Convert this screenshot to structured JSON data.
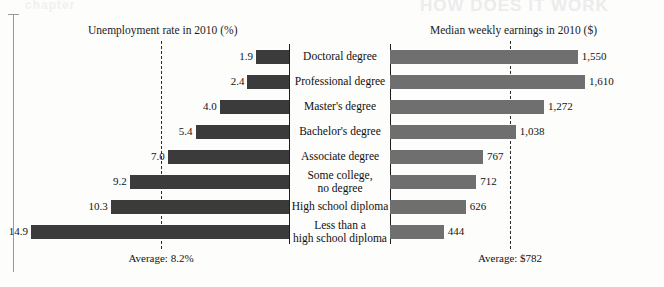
{
  "figure": {
    "left_column_title": "Unemployment rate in 2010 (%)",
    "right_column_title": "Median weekly earnings in 2010 ($)",
    "left_average_caption": "Average: 8.2%",
    "right_average_caption": "Average: $782",
    "ghost_text_top_right": "HOW DOES IT WORK",
    "ghost_text_top_left": "chapter",
    "bar_color_left": "#3b3b3b",
    "bar_color_right": "#6f6f6f",
    "axis_color": "#1f1f1f",
    "average_line_color": "#2b2b2b"
  },
  "chart_data": {
    "type": "bar",
    "orientation": "horizontal",
    "layout": "butterfly/diverging paired bars with centered category labels",
    "grid": false,
    "legend": "none",
    "categories": [
      "Doctoral degree",
      "Professional degree",
      "Master's degree",
      "Bachelor's degree",
      "Associate degree",
      "Some college,\nno degree",
      "High school diploma",
      "Less than a\nhigh school diploma"
    ],
    "category_lines": [
      [
        "Doctoral degree"
      ],
      [
        "Professional degree"
      ],
      [
        "Master's degree"
      ],
      [
        "Bachelor's degree"
      ],
      [
        "Associate degree"
      ],
      [
        "Some college,",
        "no degree"
      ],
      [
        "High school diploma"
      ],
      [
        "Less than a",
        "high school diploma"
      ]
    ],
    "series": [
      {
        "name": "Unemployment rate in 2010 (%)",
        "side": "left",
        "direction": "right-to-left",
        "unit": "%",
        "values": [
          1.9,
          2.4,
          4.0,
          5.4,
          7.0,
          9.2,
          10.3,
          14.9
        ],
        "labels": [
          "1.9",
          "2.4",
          "4.0",
          "5.4",
          "7.0",
          "9.2",
          "10.3",
          "14.9"
        ],
        "axis_max": 16.0,
        "reference_line": {
          "label": "Average: 8.2%",
          "value": 8.2
        }
      },
      {
        "name": "Median weekly earnings in 2010 ($)",
        "side": "right",
        "direction": "left-to-right",
        "unit": "$",
        "values": [
          1550,
          1610,
          1272,
          1038,
          767,
          712,
          626,
          444
        ],
        "labels": [
          "1,550",
          "1,610",
          "1,272",
          "1,038",
          "767",
          "712",
          "626",
          "444"
        ],
        "axis_max": 1750,
        "reference_line": {
          "label": "Average: $782",
          "value": 782
        }
      }
    ],
    "xlabel": "",
    "ylabel": ""
  }
}
